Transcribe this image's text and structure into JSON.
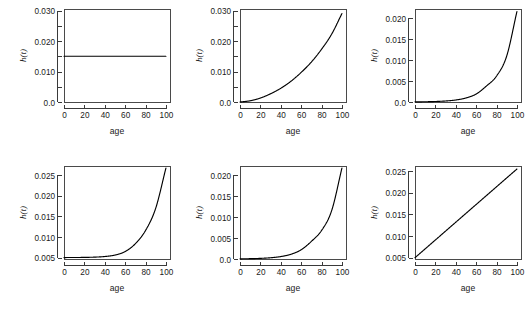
{
  "figure": {
    "layout": "2x3 grid of hazard function plots",
    "panel_count": 6,
    "shared_xlabel": "age",
    "shared_ylabel": "h(t)",
    "line_color": "#000000",
    "axis_color": "#3a3a3a",
    "background": "#ffffff"
  },
  "chart_data": [
    {
      "type": "line",
      "title": "",
      "xlabel": "age",
      "ylabel": "h(t)",
      "xlim": [
        0,
        104
      ],
      "ylim": [
        0.0,
        0.0305
      ],
      "xticks": [
        0,
        20,
        40,
        60,
        80,
        100
      ],
      "xticklabels": [
        "0",
        "20",
        "40",
        "60",
        "80",
        "100"
      ],
      "yticks": [
        0.0,
        0.005,
        0.01,
        0.015,
        0.02,
        0.025,
        0.03
      ],
      "yticklabels": [
        "0.0",
        "",
        "0.010",
        "",
        "0.020",
        "",
        "0.030"
      ],
      "grid": false,
      "legend": null,
      "series": [
        {
          "name": "constant hazard",
          "x": [
            0,
            10,
            20,
            30,
            40,
            50,
            60,
            70,
            80,
            90,
            100
          ],
          "values": [
            0.015,
            0.015,
            0.015,
            0.015,
            0.015,
            0.015,
            0.015,
            0.015,
            0.015,
            0.015,
            0.015
          ]
        }
      ]
    },
    {
      "type": "line",
      "title": "",
      "xlabel": "age",
      "ylabel": "h(t)",
      "xlim": [
        0,
        104
      ],
      "ylim": [
        0.0,
        0.0305
      ],
      "xticks": [
        0,
        20,
        40,
        60,
        80,
        100
      ],
      "xticklabels": [
        "0",
        "20",
        "40",
        "60",
        "80",
        "100"
      ],
      "yticks": [
        0.0,
        0.005,
        0.01,
        0.015,
        0.02,
        0.025,
        0.03
      ],
      "yticklabels": [
        "0.0",
        "",
        "0.010",
        "",
        "0.020",
        "",
        "0.030"
      ],
      "grid": false,
      "legend": null,
      "series": [
        {
          "name": "Weibull increasing hazard",
          "x": [
            0,
            10,
            20,
            30,
            40,
            50,
            60,
            70,
            80,
            90,
            100
          ],
          "values": [
            0.0,
            0.0004,
            0.0013,
            0.0027,
            0.0045,
            0.0068,
            0.0097,
            0.0131,
            0.0173,
            0.0223,
            0.029
          ]
        }
      ]
    },
    {
      "type": "line",
      "title": "",
      "xlabel": "age",
      "ylabel": "h(t)",
      "xlim": [
        0,
        104
      ],
      "ylim": [
        0.0,
        0.0222
      ],
      "xticks": [
        0,
        20,
        40,
        60,
        80,
        100
      ],
      "xticklabels": [
        "0",
        "20",
        "40",
        "60",
        "80",
        "100"
      ],
      "yticks": [
        0.0,
        0.005,
        0.01,
        0.015,
        0.02
      ],
      "yticklabels": [
        "0.0",
        "0.005",
        "0.010",
        "0.015",
        "0.020"
      ],
      "grid": false,
      "legend": null,
      "series": [
        {
          "name": "Gompertz exponential hazard",
          "x": [
            0,
            10,
            20,
            30,
            40,
            50,
            60,
            70,
            80,
            90,
            100
          ],
          "values": [
            3e-05,
            6e-05,
            0.00012,
            0.00024,
            0.00048,
            0.00096,
            0.0019,
            0.0038,
            0.0062,
            0.011,
            0.0216
          ]
        }
      ]
    },
    {
      "type": "line",
      "title": "",
      "xlabel": "age",
      "ylabel": "h(t)",
      "xlim": [
        0,
        104
      ],
      "ylim": [
        0.0047,
        0.0272
      ],
      "xticks": [
        0,
        20,
        40,
        60,
        80,
        100
      ],
      "xticklabels": [
        "0",
        "20",
        "40",
        "60",
        "80",
        "100"
      ],
      "yticks": [
        0.005,
        0.01,
        0.015,
        0.02,
        0.025
      ],
      "yticklabels": [
        "0.005",
        "0.010",
        "0.015",
        "0.020",
        "0.025"
      ],
      "grid": false,
      "legend": null,
      "series": [
        {
          "name": "Gompertz-Makeham hazard",
          "x": [
            0,
            10,
            20,
            30,
            40,
            50,
            60,
            70,
            80,
            90,
            100
          ],
          "values": [
            0.00505,
            0.00506,
            0.00509,
            0.00515,
            0.0053,
            0.00565,
            0.0065,
            0.0084,
            0.0116,
            0.017,
            0.0267
          ]
        }
      ]
    },
    {
      "type": "line",
      "title": "",
      "xlabel": "age",
      "ylabel": "h(t)",
      "xlim": [
        0,
        104
      ],
      "ylim": [
        0.0,
        0.0222
      ],
      "xticks": [
        0,
        20,
        40,
        60,
        80,
        100
      ],
      "xticklabels": [
        "0",
        "20",
        "40",
        "60",
        "80",
        "100"
      ],
      "yticks": [
        0.0,
        0.005,
        0.01,
        0.015,
        0.02
      ],
      "yticklabels": [
        "0.0",
        "0.005",
        "0.010",
        "0.015",
        "0.020"
      ],
      "grid": false,
      "legend": null,
      "series": [
        {
          "name": "exponential hazard",
          "x": [
            0,
            10,
            20,
            30,
            40,
            50,
            60,
            70,
            80,
            90,
            100
          ],
          "values": [
            4e-05,
            8e-05,
            0.00015,
            0.0003,
            0.00058,
            0.00113,
            0.0022,
            0.0042,
            0.0068,
            0.0116,
            0.0217
          ]
        }
      ]
    },
    {
      "type": "line",
      "title": "",
      "xlabel": "age",
      "ylabel": "h(t)",
      "xlim": [
        0,
        104
      ],
      "ylim": [
        0.0047,
        0.0262
      ],
      "xticks": [
        0,
        20,
        40,
        60,
        80,
        100
      ],
      "xticklabels": [
        "0",
        "20",
        "40",
        "60",
        "80",
        "100"
      ],
      "yticks": [
        0.005,
        0.01,
        0.015,
        0.02,
        0.025
      ],
      "yticklabels": [
        "0.005",
        "0.010",
        "0.015",
        "0.020",
        "0.025"
      ],
      "grid": false,
      "legend": null,
      "series": [
        {
          "name": "linear increasing hazard",
          "x": [
            0,
            10,
            20,
            30,
            40,
            50,
            60,
            70,
            80,
            90,
            100
          ],
          "values": [
            0.005,
            0.00705,
            0.0091,
            0.01115,
            0.0132,
            0.01525,
            0.0173,
            0.01935,
            0.0214,
            0.02345,
            0.0255
          ]
        }
      ]
    }
  ]
}
